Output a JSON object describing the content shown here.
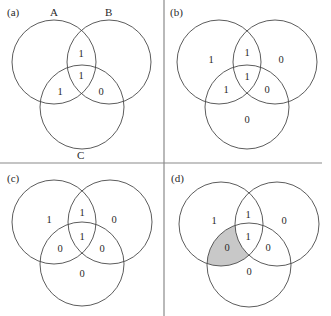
{
  "figure": {
    "dividers": {
      "vertical_x": 164,
      "horizontal_y": 163
    },
    "shade_color": "#c8c8c8",
    "panels": [
      {
        "id": "a",
        "label": "(a)",
        "set_labels": {
          "A": "A",
          "B": "B",
          "C": "C"
        },
        "regions": {
          "A_only": "",
          "B_only": "",
          "C_only": "",
          "AB": "1",
          "AC": "1",
          "BC": "0",
          "ABC": "1"
        },
        "shaded": []
      },
      {
        "id": "b",
        "label": "(b)",
        "regions": {
          "A_only": "1",
          "B_only": "0",
          "C_only": "0",
          "AB": "1",
          "AC": "1",
          "BC": "0",
          "ABC": "1"
        },
        "shaded": []
      },
      {
        "id": "c",
        "label": "(c)",
        "regions": {
          "A_only": "1",
          "B_only": "0",
          "C_only": "0",
          "AB": "1",
          "AC": "0",
          "BC": "0",
          "ABC": "1"
        },
        "shaded": []
      },
      {
        "id": "d",
        "label": "(d)",
        "regions": {
          "A_only": "1",
          "B_only": "0",
          "C_only": "0",
          "AB": "1",
          "AC": "0",
          "BC": "0",
          "ABC": "1"
        },
        "shaded": [
          "AC"
        ]
      }
    ]
  }
}
